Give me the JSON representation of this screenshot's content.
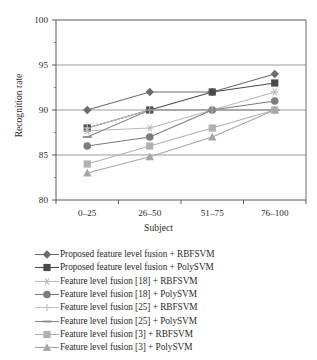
{
  "chart_data": {
    "type": "line",
    "title": "",
    "xlabel": "Subject",
    "ylabel": "Recognition rate",
    "categories": [
      "0–25",
      "26–50",
      "51–75",
      "76–100"
    ],
    "ylim": [
      80,
      100
    ],
    "yticks": [
      80,
      85,
      90,
      95,
      100
    ],
    "grid": true,
    "legend_position": "below",
    "series": [
      {
        "name": "Proposed feature level fusion + RBFSVM",
        "marker": "diamond",
        "color": "#6b6b6b",
        "values": [
          90,
          92,
          92,
          94
        ]
      },
      {
        "name": "Proposed feature level fusion + PolySVM",
        "marker": "square",
        "color": "#4a4a4a",
        "values": [
          88,
          90,
          92,
          93
        ]
      },
      {
        "name": "Feature level fusion [18] + RBFSVM",
        "marker": "star",
        "color": "#b9b9b9",
        "values": [
          87.7,
          88,
          90,
          92
        ]
      },
      {
        "name": "Feature level fusion [18] + PolySVM",
        "marker": "circle",
        "color": "#7d7d7d",
        "values": [
          86,
          87,
          90,
          91
        ]
      },
      {
        "name": "Feature level fusion [25] + RBFSVM",
        "marker": "plus",
        "color": "#c2c2c2",
        "values": [
          88,
          90,
          90,
          90
        ]
      },
      {
        "name": "Feature level fusion [25] + PolySVM",
        "marker": "line",
        "color": "#8a8a8a",
        "values": [
          87,
          90,
          90,
          90
        ]
      },
      {
        "name": "Feature level fusion [3] + RBFSVM",
        "marker": "square",
        "color": "#b0b0b0",
        "values": [
          84,
          86,
          88,
          90
        ]
      },
      {
        "name": "Feature level fusion [3] + PolySVM",
        "marker": "triangle",
        "color": "#a6a6a6",
        "values": [
          83,
          84.8,
          87,
          90
        ]
      }
    ]
  },
  "axis": {
    "y_tick_labels": [
      "100",
      "95",
      "90",
      "85",
      "80"
    ],
    "x_tick_labels": [
      "0–25",
      "26–50",
      "51–75",
      "76–100"
    ],
    "y_title": "Recognition rate",
    "x_title": "Subject"
  },
  "legend": {
    "items": [
      "Proposed feature level fusion + RBFSVM",
      "Proposed feature level fusion + PolySVM",
      "Feature level fusion [18] + RBFSVM",
      "Feature level fusion [18] + PolySVM",
      "Feature level fusion [25] + RBFSVM",
      "Feature level fusion [25] + PolySVM",
      "Feature level fusion [3] + RBFSVM",
      "Feature level fusion [3] + PolySVM"
    ]
  }
}
